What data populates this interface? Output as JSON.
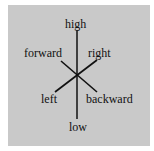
{
  "diagram": {
    "background_color": "#c9c9c9",
    "line_color": "#111111",
    "axes": [
      {
        "name": "vertical",
        "ends": [
          "high",
          "low"
        ]
      },
      {
        "name": "diagonal-1",
        "ends": [
          "forward",
          "backward"
        ]
      },
      {
        "name": "diagonal-2",
        "ends": [
          "right",
          "left"
        ]
      }
    ],
    "labels": {
      "high": "high",
      "low": "low",
      "forward": "forward",
      "right": "right",
      "left": "left",
      "backward": "backward"
    }
  }
}
